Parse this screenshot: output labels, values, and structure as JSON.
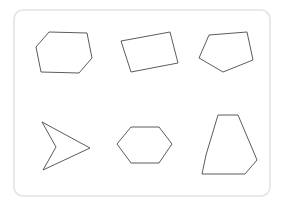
{
  "canvas": {
    "width": 284,
    "height": 211,
    "background_color": "#ffffff",
    "title": "Geometric shapes figure"
  },
  "frame": {
    "name": "rounded-panel",
    "x": 14,
    "y": 10,
    "width": 256,
    "height": 186,
    "corner_radius": 9,
    "stroke_color": "#e3e3e3",
    "fill_color": "#ffffff",
    "stroke_width": 1.6
  },
  "style": {
    "shape_stroke_color": "#4a4a4a",
    "shape_fill": "none",
    "shape_stroke_width": 0.9
  },
  "shapes": [
    {
      "id": "shape-1",
      "label": "hexagon",
      "description": "irregular convex hexagon, upper-left cell",
      "sides": 6,
      "convex": true,
      "row": 1,
      "column": 1,
      "points": "49,32 87,33 92,58 79,73 41,72 36,47"
    },
    {
      "id": "shape-2",
      "label": "quadrilateral",
      "description": "tilted rectangle / rotated quadrilateral, upper-middle cell",
      "sides": 4,
      "convex": true,
      "row": 1,
      "column": 2,
      "points": "121,41 170,32 178,63 131,72"
    },
    {
      "id": "shape-3",
      "label": "pentagon",
      "description": "irregular convex pentagon, upper-right cell",
      "sides": 5,
      "convex": true,
      "row": 1,
      "column": 3,
      "points": "209,35 247,32 253,60 223,72 199,58"
    },
    {
      "id": "shape-4",
      "label": "arrow",
      "description": "concave dart / arrowhead pointing right, lower-left cell",
      "sides": 4,
      "convex": false,
      "row": 2,
      "column": 1,
      "points": "42,122 90,148 43,170 56,147"
    },
    {
      "id": "shape-5",
      "label": "hexagon",
      "description": "regular hexagon, lower-middle cell",
      "sides": 6,
      "convex": true,
      "row": 2,
      "column": 2,
      "points": "117,144 131,127 159,127 172,144 159,163 131,163"
    },
    {
      "id": "shape-6",
      "label": "hexagon",
      "description": "tall trapezoid-like hexagon, lower-right cell",
      "sides": 6,
      "convex": true,
      "row": 2,
      "column": 3,
      "points": "218,115 238,115 257,160 245,174 202,174 206,155"
    }
  ]
}
